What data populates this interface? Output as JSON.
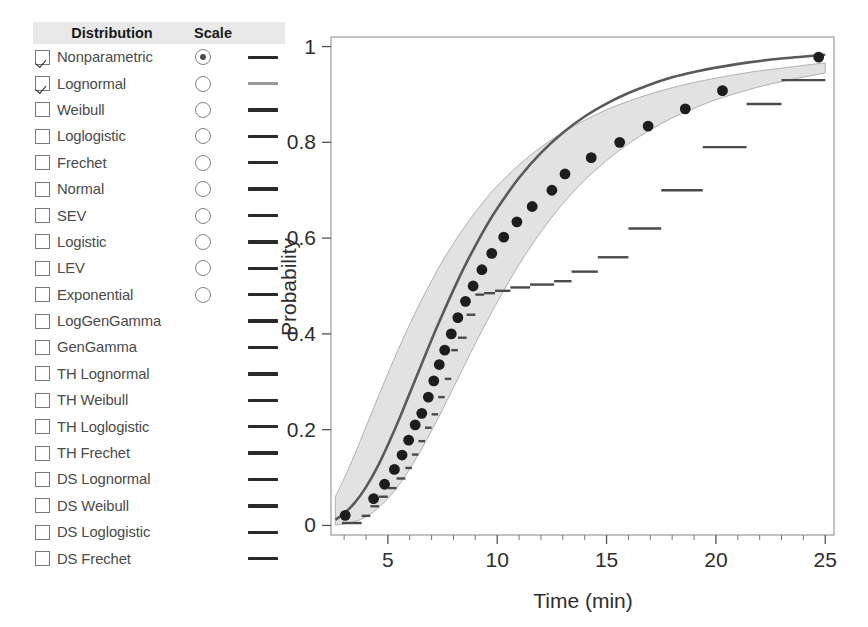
{
  "panel": {
    "headers": {
      "distribution": "Distribution",
      "scale": "Scale"
    },
    "rows": [
      {
        "label": "Nonparametric",
        "checked": true,
        "radio": true,
        "radio_selected": true,
        "swatch_color": "#2a2a2a"
      },
      {
        "label": "Lognormal",
        "checked": true,
        "radio": true,
        "radio_selected": false,
        "swatch_color": "#9a9a9a"
      },
      {
        "label": "Weibull",
        "checked": false,
        "radio": true,
        "radio_selected": false,
        "swatch_color": "#2a2a2a"
      },
      {
        "label": "Loglogistic",
        "checked": false,
        "radio": true,
        "radio_selected": false,
        "swatch_color": "#2a2a2a"
      },
      {
        "label": "Frechet",
        "checked": false,
        "radio": true,
        "radio_selected": false,
        "swatch_color": "#2a2a2a"
      },
      {
        "label": "Normal",
        "checked": false,
        "radio": true,
        "radio_selected": false,
        "swatch_color": "#2a2a2a"
      },
      {
        "label": "SEV",
        "checked": false,
        "radio": true,
        "radio_selected": false,
        "swatch_color": "#2a2a2a"
      },
      {
        "label": "Logistic",
        "checked": false,
        "radio": true,
        "radio_selected": false,
        "swatch_color": "#2a2a2a"
      },
      {
        "label": "LEV",
        "checked": false,
        "radio": true,
        "radio_selected": false,
        "swatch_color": "#2a2a2a"
      },
      {
        "label": "Exponential",
        "checked": false,
        "radio": true,
        "radio_selected": false,
        "swatch_color": "#2a2a2a"
      },
      {
        "label": "LogGenGamma",
        "checked": false,
        "radio": false,
        "radio_selected": false,
        "swatch_color": "#2a2a2a"
      },
      {
        "label": "GenGamma",
        "checked": false,
        "radio": false,
        "radio_selected": false,
        "swatch_color": "#2a2a2a"
      },
      {
        "label": "TH Lognormal",
        "checked": false,
        "radio": false,
        "radio_selected": false,
        "swatch_color": "#2a2a2a"
      },
      {
        "label": "TH Weibull",
        "checked": false,
        "radio": false,
        "radio_selected": false,
        "swatch_color": "#2a2a2a"
      },
      {
        "label": "TH Loglogistic",
        "checked": false,
        "radio": false,
        "radio_selected": false,
        "swatch_color": "#2a2a2a"
      },
      {
        "label": "TH Frechet",
        "checked": false,
        "radio": false,
        "radio_selected": false,
        "swatch_color": "#2a2a2a"
      },
      {
        "label": "DS Lognormal",
        "checked": false,
        "radio": false,
        "radio_selected": false,
        "swatch_color": "#2a2a2a"
      },
      {
        "label": "DS Weibull",
        "checked": false,
        "radio": false,
        "radio_selected": false,
        "swatch_color": "#2a2a2a"
      },
      {
        "label": "DS Loglogistic",
        "checked": false,
        "radio": false,
        "radio_selected": false,
        "swatch_color": "#2a2a2a"
      },
      {
        "label": "DS Frechet",
        "checked": false,
        "radio": false,
        "radio_selected": false,
        "swatch_color": "#2a2a2a"
      }
    ]
  },
  "chart_data": {
    "type": "line",
    "title": "",
    "xlabel": "Time (min)",
    "ylabel": "Probability",
    "xlim": [
      2.4,
      25.4
    ],
    "ylim": [
      -0.02,
      1.02
    ],
    "xticks": [
      5,
      10,
      15,
      20,
      25
    ],
    "xtick_labels": [
      "5",
      "10",
      "15",
      "20",
      "25"
    ],
    "yticks": [
      0,
      0.2,
      0.4,
      0.6,
      0.8,
      1
    ],
    "ytick_labels": [
      "0",
      "0.2",
      "0.4",
      "0.6",
      "0.8",
      "1"
    ],
    "grid": true,
    "grid_color": "#d8d8d8",
    "legend": "none",
    "colors": {
      "fit_line": "#5a5a5a",
      "band_fill": "#e2e2e2",
      "band_edge": "#b0b0b0",
      "points": "#1d1d1d",
      "step": "#4a4a4a",
      "frame": "#9a9a9a"
    },
    "series": [
      {
        "name": "Lognormal fit",
        "type": "line",
        "x": [
          2.6,
          3.0,
          3.5,
          4.0,
          4.5,
          5.0,
          5.5,
          6.0,
          6.5,
          7.0,
          7.5,
          8.0,
          8.5,
          9.0,
          9.5,
          10.0,
          11.0,
          12.0,
          13.0,
          14.0,
          15.0,
          16.0,
          17.0,
          18.0,
          19.0,
          20.0,
          21.5,
          23.0,
          25.0
        ],
        "y": [
          0.012,
          0.025,
          0.048,
          0.08,
          0.12,
          0.168,
          0.22,
          0.276,
          0.332,
          0.388,
          0.441,
          0.492,
          0.54,
          0.584,
          0.625,
          0.662,
          0.726,
          0.778,
          0.82,
          0.854,
          0.881,
          0.903,
          0.921,
          0.936,
          0.947,
          0.956,
          0.967,
          0.975,
          0.983
        ]
      },
      {
        "name": "95% confidence band lower",
        "type": "line",
        "x": [
          2.6,
          3.0,
          3.5,
          4.0,
          4.5,
          5.0,
          5.5,
          6.0,
          6.5,
          7.0,
          7.5,
          8.0,
          8.5,
          9.0,
          9.5,
          10.0,
          11.0,
          12.0,
          13.0,
          14.0,
          15.0,
          16.0,
          17.0,
          18.0,
          19.0,
          20.0,
          21.5,
          23.0,
          25.0
        ],
        "y": [
          0.001,
          0.003,
          0.008,
          0.018,
          0.034,
          0.056,
          0.084,
          0.118,
          0.156,
          0.198,
          0.242,
          0.288,
          0.334,
          0.38,
          0.424,
          0.466,
          0.545,
          0.613,
          0.672,
          0.721,
          0.762,
          0.797,
          0.826,
          0.851,
          0.871,
          0.889,
          0.91,
          0.927,
          0.945
        ]
      },
      {
        "name": "95% confidence band upper",
        "type": "line",
        "x": [
          2.6,
          3.0,
          3.5,
          4.0,
          4.5,
          5.0,
          5.5,
          6.0,
          6.5,
          7.0,
          7.5,
          8.0,
          8.5,
          9.0,
          9.5,
          10.0,
          11.0,
          12.0,
          13.0,
          14.0,
          15.0,
          16.0,
          17.0,
          18.0,
          19.0,
          20.0,
          21.5,
          23.0,
          25.0
        ],
        "y": [
          0.06,
          0.098,
          0.15,
          0.206,
          0.262,
          0.317,
          0.37,
          0.42,
          0.467,
          0.511,
          0.552,
          0.589,
          0.623,
          0.654,
          0.683,
          0.709,
          0.753,
          0.79,
          0.821,
          0.846,
          0.868,
          0.886,
          0.901,
          0.914,
          0.925,
          0.934,
          0.946,
          0.955,
          0.966
        ]
      },
      {
        "name": "Observed points",
        "type": "scatter",
        "x": [
          3.05,
          4.35,
          4.85,
          5.3,
          5.65,
          5.95,
          6.25,
          6.55,
          6.85,
          7.1,
          7.35,
          7.6,
          7.9,
          8.2,
          8.55,
          8.9,
          9.3,
          9.75,
          10.3,
          10.9,
          11.6,
          12.5,
          13.1,
          14.3,
          15.6,
          16.9,
          18.6,
          20.3,
          24.7
        ],
        "y": [
          0.021,
          0.056,
          0.086,
          0.117,
          0.147,
          0.178,
          0.21,
          0.234,
          0.268,
          0.302,
          0.336,
          0.366,
          0.4,
          0.434,
          0.468,
          0.5,
          0.534,
          0.568,
          0.602,
          0.634,
          0.666,
          0.7,
          0.734,
          0.768,
          0.8,
          0.834,
          0.87,
          0.908,
          0.978
        ]
      },
      {
        "name": "Nonparametric step estimate",
        "type": "step",
        "x": [
          2.9,
          3.8,
          4.2,
          4.6,
          5.0,
          5.4,
          5.8,
          6.1,
          6.4,
          6.7,
          7.0,
          7.3,
          7.6,
          7.9,
          8.2,
          8.6,
          9.0,
          9.4,
          9.9,
          10.6,
          11.5,
          12.6,
          13.4,
          14.6,
          16.0,
          17.5,
          19.4,
          21.4,
          23.0,
          25.0
        ],
        "y": [
          0.005,
          0.02,
          0.04,
          0.06,
          0.078,
          0.098,
          0.12,
          0.148,
          0.176,
          0.204,
          0.232,
          0.268,
          0.306,
          0.366,
          0.392,
          0.44,
          0.482,
          0.485,
          0.49,
          0.497,
          0.503,
          0.51,
          0.53,
          0.56,
          0.62,
          0.7,
          0.79,
          0.88,
          0.93,
          0.962
        ]
      }
    ]
  }
}
